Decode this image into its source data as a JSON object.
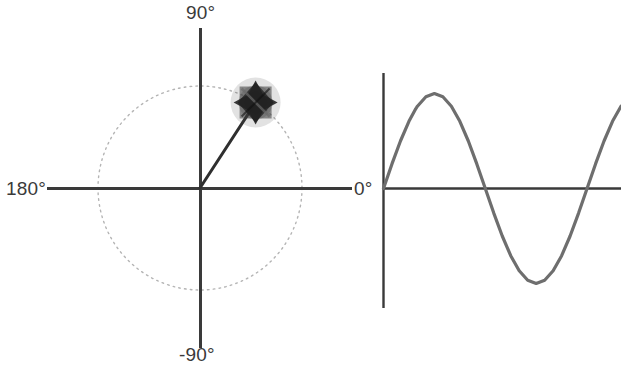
{
  "figure": {
    "background_color": "#ffffff",
    "ink_color": "#3a3a3a",
    "curve_color": "#6e6e6e",
    "circle_color": "#b9b9b9",
    "marker_color": "#2a2a2a"
  },
  "labels": {
    "deg_90": "90°",
    "deg_180": "180°",
    "deg_minus_90": "-90°",
    "deg_0": "0°"
  },
  "caption": {
    "text": ""
  },
  "chart_data": [
    {
      "type": "scatter",
      "name": "phasor-diagram",
      "title": "",
      "xlabel": "",
      "ylabel": "",
      "xlim": [
        -1.5,
        1.5
      ],
      "ylim": [
        -1.5,
        1.5
      ],
      "grid": false,
      "legend": "none",
      "axis_tick_labels": [
        "90°",
        "180°",
        "-90°",
        "0°"
      ],
      "unit_circle": {
        "center": [
          0,
          0
        ],
        "radius": 1,
        "style": "dotted"
      },
      "phasor": {
        "angle_degrees": 57,
        "magnitude": 1.0,
        "tip_x": 0.545,
        "tip_y": 0.839,
        "marker": "star-diamond"
      },
      "annotations": [
        {
          "text": "90°",
          "position": "top"
        },
        {
          "text": "180°",
          "position": "left"
        },
        {
          "text": "-90°",
          "position": "bottom"
        },
        {
          "text": "0°",
          "position": "right"
        }
      ]
    },
    {
      "type": "line",
      "name": "sine-wave",
      "title": "",
      "xlabel": "",
      "ylabel": "",
      "xlim": [
        0,
        420
      ],
      "ylim": [
        -1.15,
        1.15
      ],
      "grid": false,
      "legend": "none",
      "series": [
        {
          "name": "sin(x)",
          "x": [
            0,
            15,
            30,
            45,
            57,
            60,
            75,
            90,
            105,
            120,
            135,
            150,
            165,
            180,
            195,
            210,
            225,
            240,
            255,
            270,
            285,
            300,
            315,
            330,
            345,
            360,
            375,
            390,
            405,
            420
          ],
          "values": [
            0,
            0.259,
            0.5,
            0.707,
            0.839,
            0.866,
            0.966,
            1.0,
            0.966,
            0.866,
            0.707,
            0.5,
            0.259,
            0,
            -0.259,
            -0.5,
            -0.707,
            -0.866,
            -0.966,
            -1.0,
            -0.966,
            -0.866,
            -0.707,
            -0.5,
            -0.259,
            0,
            0.259,
            0.5,
            0.707,
            0.866
          ]
        }
      ],
      "peak": {
        "x": 90,
        "y": 1.0
      },
      "trough": {
        "x": 270,
        "y": -1.0
      },
      "zero_crossings": [
        0,
        180,
        360
      ]
    }
  ]
}
